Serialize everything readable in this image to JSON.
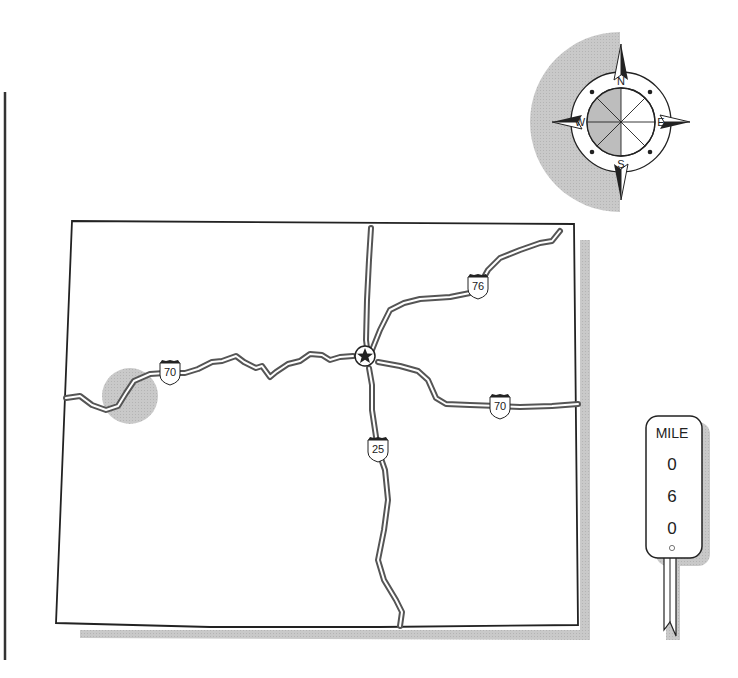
{
  "map": {
    "region": "state-outline",
    "capital_marker": "star-icon",
    "highlight_color": "#c8c8c8",
    "road_color": "#555555",
    "border_color": "#222222",
    "shadow_color": "#bdbdbd"
  },
  "highways": [
    {
      "id": "i70-west",
      "label": "70",
      "type": "interstate"
    },
    {
      "id": "i76",
      "label": "76",
      "type": "interstate"
    },
    {
      "id": "i25",
      "label": "25",
      "type": "interstate"
    },
    {
      "id": "i70-east",
      "label": "70",
      "type": "interstate"
    }
  ],
  "compass": {
    "north": "N",
    "south": "S",
    "east": "E",
    "west": "W"
  },
  "mile_marker": {
    "title": "MILE",
    "digits": [
      "0",
      "6",
      "0"
    ]
  }
}
